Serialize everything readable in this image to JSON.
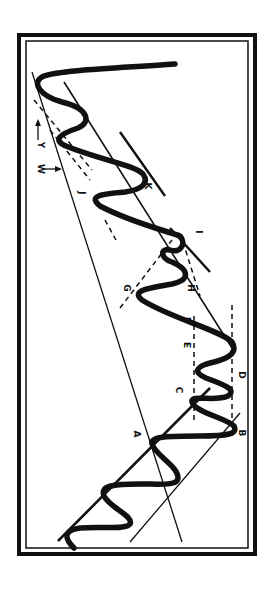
{
  "figure": {
    "ink_color": "#111111",
    "background_color": "#ffffff"
  },
  "labels": {
    "A": "A",
    "B": "B",
    "C": "C",
    "D": "D",
    "E": "E",
    "F": "F",
    "G": "G",
    "H": "H",
    "I": "I",
    "J": "J",
    "K": "K",
    "W": "W",
    "Y": "Y"
  }
}
